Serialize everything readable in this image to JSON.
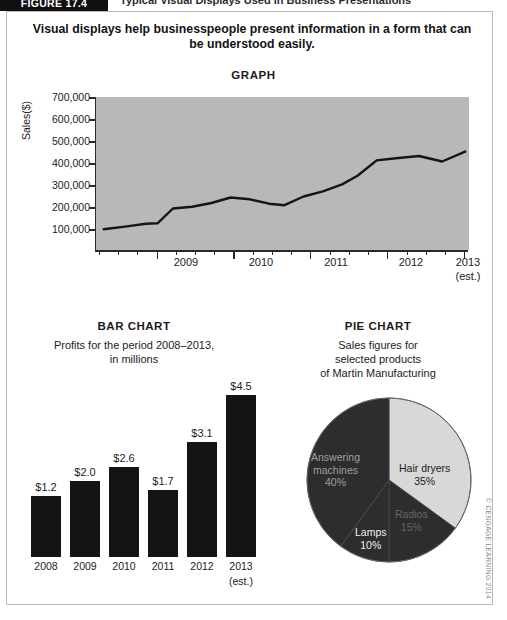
{
  "figure": {
    "tag": "FIGURE 17.4",
    "title": "Typical Visual Displays Used in Business Presentations",
    "caption": "Visual displays help businesspeople present information in a form that can be understood easily.",
    "copyright": "© CENGAGE LEARNING 2014"
  },
  "chart_data": [
    {
      "type": "line",
      "title": "GRAPH",
      "ylabel": "Sales($)",
      "xlabel": "",
      "ylim": [
        0,
        700000
      ],
      "yticks": [
        "100,000",
        "200,000",
        "300,000",
        "400,000",
        "500,000",
        "600,000",
        "700,000"
      ],
      "ytick_values": [
        100000,
        200000,
        300000,
        400000,
        500000,
        600000,
        700000
      ],
      "xticks": [
        "2009",
        "2010",
        "2011",
        "2012",
        "2013"
      ],
      "xtick_note": "(est.)",
      "grid": false,
      "legend": "none",
      "x": [
        2008.3,
        2008.6,
        2008.85,
        2009.0,
        2009.2,
        2009.45,
        2009.7,
        2009.95,
        2010.2,
        2010.45,
        2010.65,
        2010.9,
        2011.15,
        2011.4,
        2011.6,
        2011.85,
        2012.1,
        2012.4,
        2012.7,
        2013.0
      ],
      "values": [
        95000,
        108000,
        120000,
        122000,
        190000,
        198000,
        215000,
        240000,
        232000,
        212000,
        205000,
        245000,
        268000,
        300000,
        340000,
        410000,
        420000,
        430000,
        405000,
        450000
      ]
    },
    {
      "type": "bar",
      "title": "BAR CHART",
      "subtitle": "Profits for the period 2008–2013, in millions",
      "subtitle_line1": "Profits for the period 2008–2013,",
      "subtitle_line2": "in millions",
      "categories": [
        "2008",
        "2009",
        "2010",
        "2011",
        "2012",
        "2013"
      ],
      "category_note": "(est.)",
      "values": [
        1.2,
        2.0,
        2.6,
        1.7,
        3.1,
        4.5
      ],
      "value_labels": [
        "$1.2",
        "$2.0",
        "$2.6",
        "$1.7",
        "$3.1",
        "$4.5"
      ],
      "ylim": [
        0,
        4.5
      ],
      "grid": false,
      "bar_color": "#141414"
    },
    {
      "type": "pie",
      "title": "PIE CHART",
      "subtitle": "Sales figures for selected products of Martin Manufacturing",
      "subtitle_line1": "Sales figures for",
      "subtitle_line2": "selected products",
      "subtitle_line3": "of Martin Manufacturing",
      "labels": [
        "Hair dryers",
        "Radios",
        "Lamps",
        "Answering machines"
      ],
      "values": [
        35,
        15,
        10,
        40
      ],
      "value_labels": [
        "35%",
        "15%",
        "10%",
        "40%"
      ],
      "slice_colors": [
        "#d8d8d8",
        "#2d2d2d",
        "#2d2d2d",
        "#2d2d2d"
      ],
      "label_text_colors": [
        "#1b1b1b",
        "#d9d9d9",
        "#ededed",
        "#dcdcdc"
      ]
    }
  ]
}
